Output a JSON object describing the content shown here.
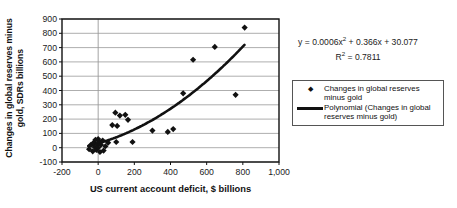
{
  "chart_data": {
    "type": "scatter",
    "title": "",
    "xlabel": "US current account deficit, $ billions",
    "ylabel": "Changes in global reserves minus gold, SDRs billions",
    "ylabel_lines": [
      "Changes in global reserves minus",
      "gold, SDRs billions"
    ],
    "xlim": [
      -200,
      1000
    ],
    "ylim": [
      -100,
      900
    ],
    "x_ticks": [
      -200,
      0,
      200,
      400,
      600,
      800,
      1000
    ],
    "x_tick_labels": [
      "-200",
      "0",
      "200",
      "400",
      "600",
      "800",
      "1,000"
    ],
    "y_ticks": [
      900,
      800,
      700,
      600,
      500,
      400,
      300,
      200,
      100,
      0,
      -100
    ],
    "y_tick_labels": [
      "900",
      "800",
      "700",
      "600",
      "500",
      "400",
      "300",
      "200",
      "100",
      "0",
      "-100"
    ],
    "grid": "horizontal",
    "vertical_axis_at_x": 0,
    "colors": {
      "marker": "#111111",
      "trendline": "#111111",
      "gridline": "#999999",
      "border": "#111111",
      "text": "#1a1a1a"
    },
    "series": [
      {
        "name": "Changes in global reserves minus gold",
        "type": "scatter",
        "marker": "diamond",
        "points": [
          [
            -50,
            -10
          ],
          [
            -40,
            20
          ],
          [
            -30,
            -25
          ],
          [
            -25,
            35
          ],
          [
            -20,
            5
          ],
          [
            -15,
            55
          ],
          [
            -10,
            -15
          ],
          [
            -5,
            25
          ],
          [
            0,
            60
          ],
          [
            0,
            0
          ],
          [
            5,
            40
          ],
          [
            10,
            -30
          ],
          [
            15,
            20
          ],
          [
            25,
            50
          ],
          [
            30,
            -20
          ],
          [
            40,
            10
          ],
          [
            55,
            35
          ],
          [
            78,
            158
          ],
          [
            105,
            152
          ],
          [
            100,
            40
          ],
          [
            95,
            245
          ],
          [
            120,
            225
          ],
          [
            150,
            230
          ],
          [
            165,
            195
          ],
          [
            190,
            40
          ],
          [
            300,
            120
          ],
          [
            385,
            110
          ],
          [
            415,
            130
          ],
          [
            470,
            380
          ],
          [
            525,
            615
          ],
          [
            645,
            705
          ],
          [
            760,
            370
          ],
          [
            810,
            840
          ]
        ]
      },
      {
        "name": "Polynomial (Changes in global reserves minus gold)",
        "type": "polynomial-trendline",
        "degree": 2,
        "coefficients": {
          "a": 0.0006,
          "b": 0.366,
          "c": 30.077
        },
        "x_range": [
          -55,
          812
        ]
      }
    ],
    "equation": {
      "p1": "y = 0.0006x",
      "sup1": "2",
      "p2": " + 0.366x + 30.077",
      "r1": "R",
      "rsup": "2",
      "r2": " = 0.7811"
    },
    "legend": {
      "entries": [
        {
          "marker": "diamond",
          "lines": [
            "Changes in global reserves",
            "minus gold"
          ]
        },
        {
          "marker": "line",
          "lines": [
            "Polynomial (Changes in global",
            "reserves minus gold)"
          ]
        }
      ]
    }
  }
}
